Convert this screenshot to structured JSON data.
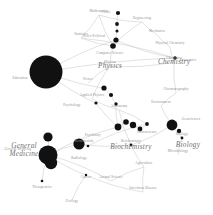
{
  "style": {
    "background": "#ffffff",
    "node_color": "#111111",
    "edge_color": "#c9c9c9",
    "label_color": "#8d8d8d",
    "major_label_color": "#6f6f6f"
  },
  "chart_data": {
    "type": "scatter",
    "xlabel": "",
    "ylabel": "",
    "xlim": [
      0,
      213
    ],
    "ylim": [
      0,
      215
    ],
    "grid": false,
    "legend": null,
    "node_size_units": "radius_px",
    "nodes": [
      {
        "id": "cities",
        "label": "Cities",
        "x": 118,
        "y": 13,
        "size": 2.1,
        "label_dx": -12,
        "label_dy": -1
      },
      {
        "id": "socio-political",
        "label": "Socio-Political",
        "x": 116,
        "y": 40,
        "size": 2.6,
        "label_dx": -22,
        "label_dy": 0
      },
      {
        "id": "node-sp-a",
        "label": "",
        "x": 117,
        "y": 24,
        "size": 1.9,
        "label_dx": 0,
        "label_dy": 0
      },
      {
        "id": "node-sp-b",
        "label": "",
        "x": 117,
        "y": 31,
        "size": 1.5,
        "label_dx": 0,
        "label_dy": 0
      },
      {
        "id": "economics",
        "label": "Economics",
        "x": 175,
        "y": 58,
        "size": 1.8,
        "label_dx": 13,
        "label_dy": 2
      },
      {
        "id": "education",
        "label": "Education",
        "x": 46,
        "y": 72,
        "size": 16.5,
        "label_dx": -26,
        "label_dy": 6
      },
      {
        "id": "node-ed-a",
        "label": "",
        "x": 104,
        "y": 88,
        "size": 2.6,
        "label_dx": 0,
        "label_dy": 0
      },
      {
        "id": "node-ed-b",
        "label": "",
        "x": 111,
        "y": 95,
        "size": 2.1,
        "label_dx": 0,
        "label_dy": 0
      },
      {
        "id": "node-ed-c",
        "label": "",
        "x": 116,
        "y": 104,
        "size": 1.7,
        "label_dx": 0,
        "label_dy": 0
      },
      {
        "id": "psychology",
        "label": "Psychology",
        "x": 96,
        "y": 103,
        "size": 1.6,
        "label_dx": -24,
        "label_dy": 2
      },
      {
        "id": "psychiatry",
        "label": "Psychiatry",
        "x": 118,
        "y": 127,
        "size": 3.4,
        "label_dx": -25,
        "label_dy": 0
      },
      {
        "id": "node-ps-a",
        "label": "",
        "x": 126,
        "y": 122,
        "size": 2.8,
        "label_dx": 0,
        "label_dy": 0
      },
      {
        "id": "node-ps-b",
        "label": "",
        "x": 133,
        "y": 125,
        "size": 3.2,
        "label_dx": 0,
        "label_dy": 0
      },
      {
        "id": "node-ps-c",
        "label": "",
        "x": 140,
        "y": 129,
        "size": 2.4,
        "label_dx": 0,
        "label_dy": 0
      },
      {
        "id": "neuroscience",
        "label": "Neuroscience",
        "x": 147,
        "y": 124,
        "size": 1.9,
        "label_dx": 0,
        "label_dy": 8
      },
      {
        "id": "general-medicine",
        "label": "General Medicine",
        "x": 48,
        "y": 155,
        "size": 9.5,
        "label_dx": -30,
        "label_dy": -6
      },
      {
        "id": "node-gm-a",
        "label": "",
        "x": 48,
        "y": 137,
        "size": 4.6,
        "label_dx": 0,
        "label_dy": 0
      },
      {
        "id": "node-gm-b",
        "label": "",
        "x": 51,
        "y": 163,
        "size": 6.2,
        "label_dx": 0,
        "label_dy": 0
      },
      {
        "id": "therapeutics",
        "label": "Therapeutics",
        "x": 42,
        "y": 181,
        "size": 1.3,
        "label_dx": 0,
        "label_dy": 6
      },
      {
        "id": "biomaterials",
        "label": "Biomaterials",
        "x": 88,
        "y": 146,
        "size": 1.3,
        "label_dx": -4,
        "label_dy": -5
      },
      {
        "id": "radiology",
        "label": "Radiology",
        "x": 79,
        "y": 144,
        "size": 5.6,
        "label_dx": 0,
        "label_dy": 14
      },
      {
        "id": "cancer",
        "label": "Cancer",
        "x": 86,
        "y": 175,
        "size": 1.2,
        "label_dx": 0,
        "label_dy": 2
      },
      {
        "id": "urology",
        "label": "Urology",
        "x": 72,
        "y": 200,
        "size": 1.1,
        "label_dx": 0,
        "label_dy": 1
      },
      {
        "id": "biochemistry",
        "label": "Biochemistry",
        "x": 131,
        "y": 145,
        "size": 1.4,
        "label_dx": 0,
        "label_dy": 0
      },
      {
        "id": "biology",
        "label": "Biology",
        "x": 182,
        "y": 138,
        "size": 1.4,
        "label_dx": 0,
        "label_dy": 0
      },
      {
        "id": "geosciences",
        "label": "Geosciences",
        "x": 172,
        "y": 125,
        "size": 5.4,
        "label_dx": 19,
        "label_dy": -6
      },
      {
        "id": "node-bio-a",
        "label": "",
        "x": 179,
        "y": 131,
        "size": 2.2,
        "label_dx": 0,
        "label_dy": 0
      },
      {
        "id": "microbiology",
        "label": "Microbiology",
        "x": 178,
        "y": 155,
        "size": 1.1,
        "label_dx": 0,
        "label_dy": 0
      },
      {
        "id": "agriculture",
        "label": "Agriculture",
        "x": 144,
        "y": 167,
        "size": 1.0,
        "label_dx": 0,
        "label_dy": 0
      },
      {
        "id": "animal-science",
        "label": "Animal Science",
        "x": 111,
        "y": 181,
        "size": 1.0,
        "label_dx": 0,
        "label_dy": 0
      },
      {
        "id": "infectious-disease",
        "label": "Infectious Disease",
        "x": 143,
        "y": 192,
        "size": 1.0,
        "label_dx": 0,
        "label_dy": 0
      },
      {
        "id": "computer-science",
        "label": "Computer Science",
        "x": 113,
        "y": 46,
        "size": 2.8,
        "label_dx": -3,
        "label_dy": 7
      },
      {
        "id": "mathematics",
        "label": "Mathematics",
        "x": 99,
        "y": 15,
        "size": 1.1,
        "label_dx": 0,
        "label_dy": 0
      },
      {
        "id": "statistics",
        "label": "Statistics",
        "x": 81,
        "y": 38,
        "size": 1.0,
        "label_dx": 0,
        "label_dy": 0
      },
      {
        "id": "engineering",
        "label": "Engineering",
        "x": 142,
        "y": 22,
        "size": 1.0,
        "label_dx": 0,
        "label_dy": 0
      },
      {
        "id": "mechanics",
        "label": "Mechanics",
        "x": 157,
        "y": 35,
        "size": 1.0,
        "label_dx": 0,
        "label_dy": 0
      },
      {
        "id": "physical-chemistry",
        "label": "Physical Chemistry",
        "x": 170,
        "y": 47,
        "size": 1.0,
        "label_dx": 0,
        "label_dy": 0
      },
      {
        "id": "physics",
        "label": "Physics",
        "x": 110,
        "y": 66,
        "size": 1.0,
        "label_dx": 0,
        "label_dy": 0
      },
      {
        "id": "power",
        "label": "Power",
        "x": 88,
        "y": 83,
        "size": 1.0,
        "label_dx": 0,
        "label_dy": 0
      },
      {
        "id": "applied-physics",
        "label": "Applied Physics",
        "x": 92,
        "y": 99,
        "size": 1.0,
        "label_dx": 0,
        "label_dy": 0
      },
      {
        "id": "astronomy",
        "label": "Astronomy",
        "x": 119,
        "y": 110,
        "size": 1.0,
        "label_dx": 0,
        "label_dy": 0
      },
      {
        "id": "chemistry",
        "label": "Chemistry",
        "x": 174,
        "y": 62,
        "size": 1.0,
        "label_dx": 0,
        "label_dy": 0
      },
      {
        "id": "chromatography",
        "label": "Chromatography",
        "x": 176,
        "y": 93,
        "size": 1.0,
        "label_dx": 0,
        "label_dy": 0
      },
      {
        "id": "environment",
        "label": "Environment",
        "x": 161,
        "y": 106,
        "size": 1.0,
        "label_dx": 0,
        "label_dy": 0
      }
    ],
    "major_labels": [
      {
        "id": "physics-major",
        "label": "Physics",
        "x": 110,
        "y": 66
      },
      {
        "id": "chemistry-major",
        "label": "Chemistry",
        "x": 174,
        "y": 62
      },
      {
        "id": "biology-major",
        "label": "Biology",
        "x": 188,
        "y": 145
      },
      {
        "id": "biochemistry-major",
        "label": "Biochemistry",
        "x": 131,
        "y": 147
      },
      {
        "id": "general-medicine-major",
        "label": "General Medicine",
        "x": 24,
        "y": 150
      }
    ],
    "edges": [
      {
        "from": "cities",
        "to": "node-sp-a"
      },
      {
        "from": "node-sp-a",
        "to": "node-sp-b"
      },
      {
        "from": "node-sp-b",
        "to": "socio-political"
      },
      {
        "from": "socio-political",
        "to": "economics"
      },
      {
        "from": "socio-political",
        "to": "education"
      },
      {
        "from": "economics",
        "to": "education"
      },
      {
        "from": "economics",
        "to": "statistics"
      },
      {
        "from": "statistics",
        "to": "mathematics"
      },
      {
        "from": "statistics",
        "to": "computer-science"
      },
      {
        "from": "mathematics",
        "to": "computer-science"
      },
      {
        "from": "mathematics",
        "to": "engineering"
      },
      {
        "from": "engineering",
        "to": "mechanics"
      },
      {
        "from": "engineering",
        "to": "computer-science"
      },
      {
        "from": "mechanics",
        "to": "physical-chemistry"
      },
      {
        "from": "physical-chemistry",
        "to": "chemistry"
      },
      {
        "from": "computer-science",
        "to": "physics"
      },
      {
        "from": "physics",
        "to": "applied-physics"
      },
      {
        "from": "physics",
        "to": "power"
      },
      {
        "from": "physics",
        "to": "chemistry"
      },
      {
        "from": "applied-physics",
        "to": "astronomy"
      },
      {
        "from": "astronomy",
        "to": "biochemistry"
      },
      {
        "from": "chemistry",
        "to": "chromatography"
      },
      {
        "from": "chromatography",
        "to": "environment"
      },
      {
        "from": "environment",
        "to": "geosciences"
      },
      {
        "from": "geosciences",
        "to": "biology"
      },
      {
        "from": "biology",
        "to": "microbiology"
      },
      {
        "from": "biochemistry",
        "to": "geosciences"
      },
      {
        "from": "biochemistry",
        "to": "agriculture"
      },
      {
        "from": "agriculture",
        "to": "infectious-disease"
      },
      {
        "from": "agriculture",
        "to": "animal-science"
      },
      {
        "from": "animal-science",
        "to": "general-medicine"
      },
      {
        "from": "education",
        "to": "node-ed-a"
      },
      {
        "from": "node-ed-a",
        "to": "node-ed-b"
      },
      {
        "from": "node-ed-b",
        "to": "node-ed-c"
      },
      {
        "from": "node-ed-c",
        "to": "psychiatry"
      },
      {
        "from": "education",
        "to": "psychology"
      },
      {
        "from": "psychology",
        "to": "psychiatry"
      },
      {
        "from": "psychiatry",
        "to": "node-ps-a"
      },
      {
        "from": "node-ps-a",
        "to": "node-ps-b"
      },
      {
        "from": "node-ps-b",
        "to": "node-ps-c"
      },
      {
        "from": "node-ps-c",
        "to": "neuroscience"
      },
      {
        "from": "neuroscience",
        "to": "biomaterials"
      },
      {
        "from": "biomaterials",
        "to": "radiology"
      },
      {
        "from": "radiology",
        "to": "general-medicine"
      },
      {
        "from": "general-medicine",
        "to": "node-gm-a"
      },
      {
        "from": "general-medicine",
        "to": "node-gm-b"
      },
      {
        "from": "general-medicine",
        "to": "therapeutics"
      },
      {
        "from": "general-medicine",
        "to": "cancer"
      },
      {
        "from": "cancer",
        "to": "urology"
      },
      {
        "from": "cancer",
        "to": "infectious-disease"
      },
      {
        "from": "radiology",
        "to": "biochemistry"
      },
      {
        "from": "neuroscience",
        "to": "astronomy"
      },
      {
        "from": "psychiatry",
        "to": "general-medicine"
      }
    ]
  }
}
